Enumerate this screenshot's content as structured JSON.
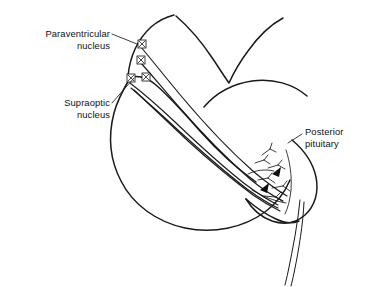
{
  "figure": {
    "background_color": "#ffffff",
    "ink_color": "#1a1a1a",
    "width": 370,
    "height": 287
  },
  "labels": {
    "paraventricular": {
      "line1": "Paraventricular",
      "line2": "nucleus",
      "align": "right"
    },
    "supraoptic": {
      "line1": "Supraoptic",
      "line2": "nucleus",
      "align": "right"
    },
    "posterior_pituitary": {
      "line1": "Posterior",
      "line2": "pituitary",
      "align": "left"
    }
  },
  "structures": {
    "paraventricular_somas": 2,
    "supraoptic_somas": 2,
    "axon_fibers": 5,
    "terminal_arrowheads": 2,
    "vessel_lines": 2
  }
}
